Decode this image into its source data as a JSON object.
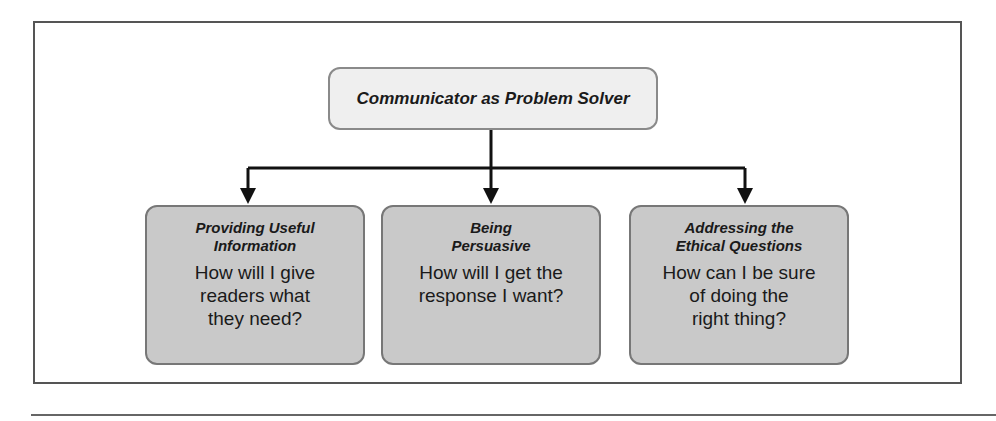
{
  "diagram": {
    "root": {
      "label": "Communicator as Problem Solver"
    },
    "children": [
      {
        "heading_line1": "Providing Useful",
        "heading_line2": "Information",
        "body_line1": "How will I give",
        "body_line2": "readers what",
        "body_line3": "they need?"
      },
      {
        "heading_line1": "Being",
        "heading_line2": "Persuasive",
        "body_line1": "How will I get the",
        "body_line2": "response I want?",
        "body_line3": ""
      },
      {
        "heading_line1": "Addressing the",
        "heading_line2": "Ethical Questions",
        "body_line1": "How can I be sure",
        "body_line2": "of doing the",
        "body_line3": "right thing?"
      }
    ],
    "colors": {
      "root_fill": "#efefef",
      "child_fill": "#c9c9c9",
      "border": "#777777",
      "connector": "#111111"
    }
  }
}
